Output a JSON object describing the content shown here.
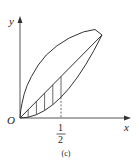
{
  "figure": {
    "caption": "(c)",
    "axes": {
      "x_label": "x",
      "y_label": "y",
      "origin_label": "O"
    },
    "tick": {
      "x_value": 0.5,
      "numerator": "1",
      "denominator": "2"
    },
    "curves": [
      {
        "name": "upper-curve",
        "expr": "y = sqrt(x)"
      },
      {
        "name": "middle-line",
        "expr": "y = x"
      },
      {
        "name": "lower-curve",
        "expr": "y = x^2"
      }
    ],
    "shaded_region": {
      "between": [
        "y = x",
        "y = x^2"
      ],
      "x_range": [
        0,
        0.5
      ],
      "style": "vertical hatching"
    },
    "colors": {
      "stroke": "#333333",
      "background": "#ffffff"
    }
  }
}
